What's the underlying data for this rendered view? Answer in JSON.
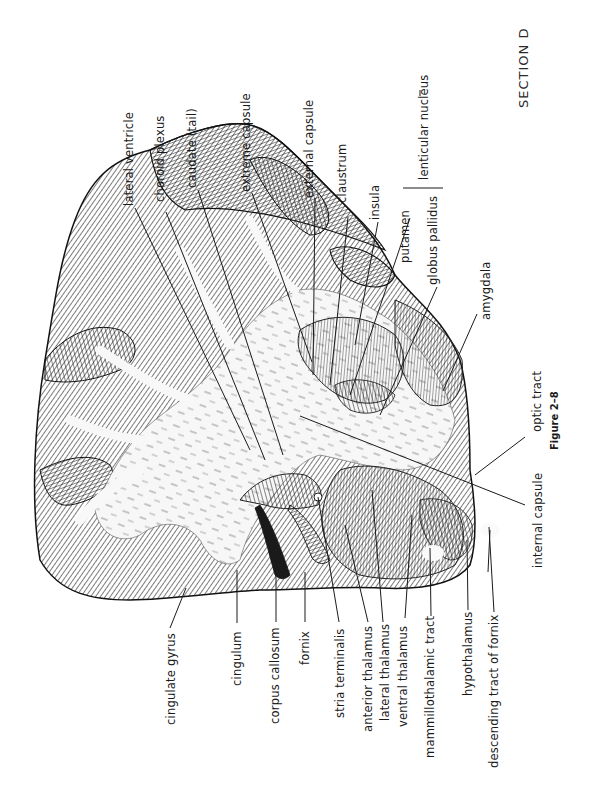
{
  "page": {
    "section_title": "SECTION D",
    "figure_caption": "Figure 2–8",
    "orientation": "rotated 90° counter-clockwise"
  },
  "diagram": {
    "labels_top": [
      {
        "id": "lateral-ventricle",
        "text": "lateral ventricle"
      },
      {
        "id": "choroid-plexus",
        "text": "choroid plexus"
      },
      {
        "id": "caudate-tail",
        "text": "caudate (tail)"
      },
      {
        "id": "extreme-capsule",
        "text": "extreme capsule"
      },
      {
        "id": "external-capsule",
        "text": "external capsule"
      },
      {
        "id": "claustrum",
        "text": "claustrum"
      },
      {
        "id": "insula",
        "text": "insula"
      },
      {
        "id": "putamen",
        "text": "putamen"
      },
      {
        "id": "globus-pallidus",
        "text": "globus pallidus"
      },
      {
        "id": "lenticular-nucleus",
        "text": "lenticular nucleus"
      },
      {
        "id": "amygdala",
        "text": "amygdala"
      },
      {
        "id": "optic-tract",
        "text": "optic tract"
      },
      {
        "id": "internal-capsule",
        "text": "internal capsule"
      }
    ],
    "labels_bottom": [
      {
        "id": "cingulate-gyrus",
        "text": "cingulate gyrus"
      },
      {
        "id": "cingulum",
        "text": "cingulum"
      },
      {
        "id": "corpus-callosum",
        "text": "corpus callosum"
      },
      {
        "id": "fornix",
        "text": "fornix"
      },
      {
        "id": "stria-terminalis",
        "text": "stria terminalis"
      },
      {
        "id": "anterior-thalamus",
        "text": "anterior thalamus"
      },
      {
        "id": "lateral-thalamus",
        "text": "lateral thalamus"
      },
      {
        "id": "ventral-thalamus",
        "text": "ventral thalamus"
      },
      {
        "id": "mammillothalamic-tract",
        "text": "mammillothalamic tract"
      },
      {
        "id": "hypothalamus",
        "text": "hypothalamus"
      },
      {
        "id": "descending-tract-of-fornix",
        "text": "descending tract of fornix"
      }
    ]
  },
  "colors": {
    "ink": "#1a1a1a",
    "paper": "#ffffff",
    "white_matter": "#f6f6f6"
  }
}
